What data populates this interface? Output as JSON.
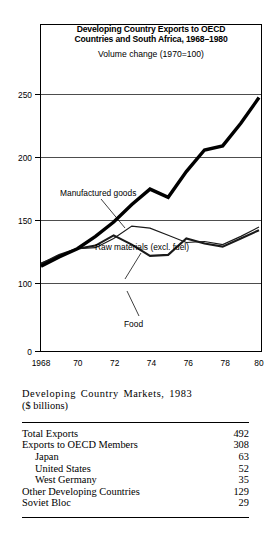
{
  "figure": {
    "title_line1": "Developing Country Exports to OECD",
    "title_line2": "Countries and South Africa, 1968–1980",
    "subtitle": "Volume change (1970=100)"
  },
  "chart_data": {
    "type": "line",
    "subtitle": "Volume change (1970=100)",
    "xlabel": "",
    "ylabel": "",
    "x": [
      1968,
      1969,
      1970,
      1971,
      1972,
      1973,
      1974,
      1975,
      1976,
      1977,
      1978,
      1979,
      1980
    ],
    "tick_labels_x": [
      "1968",
      "",
      "70",
      "",
      "72",
      "",
      "74",
      "",
      "76",
      "",
      "78",
      "",
      "80"
    ],
    "xtick_values": [
      1968,
      1970,
      1972,
      1974,
      1976,
      1978,
      1980
    ],
    "xtick_text": [
      "1968",
      "70",
      "72",
      "74",
      "76",
      "78",
      "80"
    ],
    "ytick_values": [
      0,
      100,
      150,
      200,
      250
    ],
    "ytick_text": [
      "0",
      "100",
      "150",
      "200",
      "250"
    ],
    "ylim": [
      0,
      265
    ],
    "xlim": [
      1968,
      1980
    ],
    "grid": true,
    "legend_position": "inline-annotations",
    "series": [
      {
        "name": "Manufactured goods",
        "style": "thick",
        "values": [
          83,
          92,
          100,
          112,
          126,
          143,
          158,
          150,
          175,
          196,
          200,
          222,
          247
        ]
      },
      {
        "name": "Raw materials (excl. fuel)",
        "style": "thin",
        "values": [
          86,
          93,
          100,
          101,
          110,
          122,
          120,
          113,
          106,
          107,
          104,
          112,
          121
        ]
      },
      {
        "name": "Food",
        "style": "medium",
        "values": [
          85,
          94,
          100,
          103,
          113,
          104,
          93,
          94,
          110,
          105,
          102,
          110,
          118
        ]
      }
    ],
    "annotations": [
      {
        "text": "Manufactured goods",
        "points_to_series": "Manufactured goods"
      },
      {
        "text": "Raw materials (excl. fuel)",
        "points_to_series": "Raw materials (excl. fuel)"
      },
      {
        "text": "Food",
        "points_to_series": "Food"
      }
    ]
  },
  "table": {
    "caption_line1": "Developing Country Markets, 1983",
    "caption_line2": "($ billions)",
    "rows": [
      {
        "label": "Total Exports",
        "value": "492",
        "indent": 0
      },
      {
        "label": "Exports to OECD Members",
        "value": "308",
        "indent": 0
      },
      {
        "label": "Japan",
        "value": "63",
        "indent": 1
      },
      {
        "label": "United States",
        "value": "52",
        "indent": 1
      },
      {
        "label": "West Germany",
        "value": "35",
        "indent": 1
      },
      {
        "label": "Other Developing Countries",
        "value": "129",
        "indent": 0
      },
      {
        "label": "Soviet Bloc",
        "value": "29",
        "indent": 0
      }
    ]
  }
}
